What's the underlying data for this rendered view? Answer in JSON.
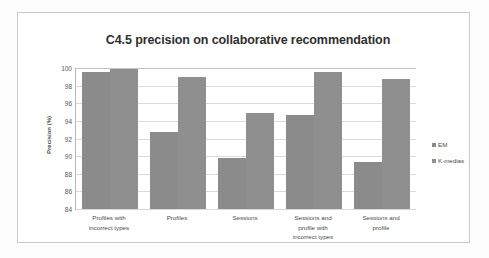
{
  "chart_data": {
    "type": "bar",
    "title": "C4.5 precision on collaborative recommendation",
    "xlabel": "",
    "ylabel": "Precision (%)",
    "ylim": [
      84,
      100
    ],
    "yticks": [
      84,
      86,
      88,
      90,
      92,
      94,
      96,
      98,
      100
    ],
    "grid": true,
    "legend_position": "right",
    "categories": [
      "Profiles with incorrect types",
      "Profiles",
      "Sessions",
      "Sessions and profile with incorrect types",
      "Sessions and profile"
    ],
    "category_lines": [
      [
        "Profiles with",
        "incorrect types"
      ],
      [
        "Profiles"
      ],
      [
        "Sessions"
      ],
      [
        "Sessions and",
        "profile with",
        "incorrect types"
      ],
      [
        "Sessions and",
        "profile"
      ]
    ],
    "series": [
      {
        "name": "EM",
        "color": "#8b8b8b",
        "values": [
          99.6,
          92.7,
          89.8,
          94.7,
          89.3
        ]
      },
      {
        "name": "K-medias",
        "color": "#8f8f8f",
        "values": [
          99.85,
          99.0,
          94.95,
          99.55,
          98.7
        ]
      }
    ]
  },
  "legend": {
    "items": [
      {
        "label": "EM"
      },
      {
        "label": "K-medias"
      }
    ]
  },
  "colors": {
    "bar_series_1": "#8b8b8b",
    "bar_series_2": "#8f8f8f",
    "gridline": "#dadada",
    "axis": "#b6b6b6",
    "frame": "#c9c9c9",
    "text": "#4a4a4a",
    "background": "#ffffff"
  }
}
